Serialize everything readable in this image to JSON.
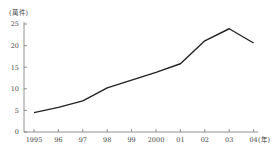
{
  "chart_data": {
    "type": "line",
    "title": "",
    "xlabel": "(年)",
    "ylabel": "(萬件)",
    "categories": [
      "1995",
      "96",
      "97",
      "98",
      "99",
      "2000",
      "01",
      "02",
      "03",
      "04"
    ],
    "series": [
      {
        "name": "",
        "values": [
          4.5,
          5.7,
          7.2,
          10.2,
          12.0,
          13.8,
          15.8,
          21.1,
          23.9,
          20.6
        ]
      }
    ],
    "yticks": [
      0,
      5,
      10,
      15,
      20,
      25
    ],
    "ylim": [
      0,
      25
    ],
    "grid": false,
    "legend": "none"
  }
}
